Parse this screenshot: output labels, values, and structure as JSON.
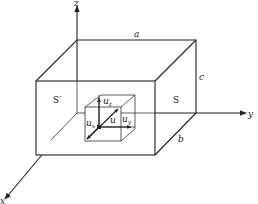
{
  "diagram": {
    "type": "3d-box-with-coordinate-axes",
    "axes": {
      "x": {
        "label": "x"
      },
      "y": {
        "label": "y"
      },
      "z": {
        "label": "z"
      }
    },
    "outer_box": {
      "dimension_labels": {
        "a": "a",
        "b": "b",
        "c": "c"
      },
      "face_labels": {
        "left": "S′",
        "right": "S"
      }
    },
    "inner_cube": {
      "vector_label": "u",
      "components": {
        "ux": "u",
        "uy": "u",
        "uz": "u"
      },
      "component_subscripts": {
        "ux": "x",
        "uy": "y",
        "uz": "z"
      }
    },
    "colors": {
      "line": "#222222",
      "background": "#ffffff"
    }
  }
}
